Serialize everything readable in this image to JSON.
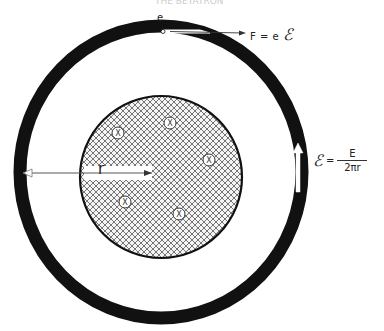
{
  "diagram": {
    "header_fragment": "THE BETATRON",
    "electron_label": "e",
    "force_label": {
      "prefix": "F = e",
      "symbol": "ℰ"
    },
    "radius_label": "r",
    "field_equation": {
      "symbol": "ℰ",
      "equals": "=",
      "numerator": "E",
      "denominator": "2πr"
    },
    "orbit_ring": {
      "color": "#111111",
      "center": [
        161,
        172
      ],
      "rx": 141,
      "ry": 146,
      "stroke_width": 13
    },
    "flux_disk": {
      "center": [
        161,
        177
      ],
      "radius": 81,
      "hatch": "crosshatch",
      "outline_color": "#111111"
    },
    "field_markers": [
      {
        "symbol": "x",
        "x": 118,
        "y": 133
      },
      {
        "symbol": "x",
        "x": 170,
        "y": 123
      },
      {
        "symbol": "x",
        "x": 209,
        "y": 160
      },
      {
        "symbol": "x",
        "x": 125,
        "y": 202
      },
      {
        "symbol": "x",
        "x": 179,
        "y": 214
      }
    ],
    "arrows": [
      {
        "name": "force-arrow",
        "direction": "right"
      },
      {
        "name": "radius-arrow",
        "direction": "left-and-right"
      },
      {
        "name": "field-arrow",
        "direction": "up"
      }
    ]
  }
}
